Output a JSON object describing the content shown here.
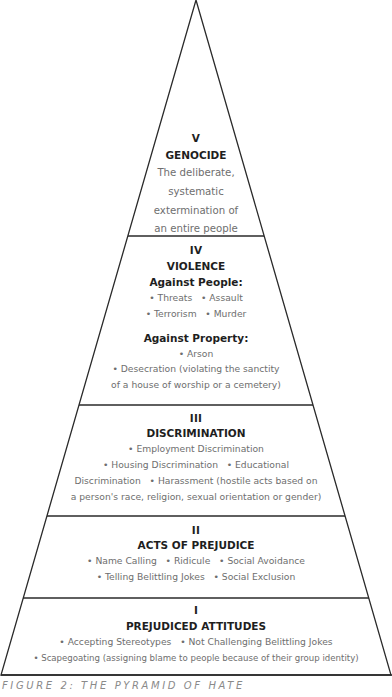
{
  "figure": {
    "caption": "FIGURE 2: THE PYRAMID OF HATE",
    "colors": {
      "line": "#2a2a2a",
      "heading": "#1e1e1e",
      "body": "#6e6e6e",
      "caption": "#8a8a8a"
    }
  },
  "levels": [
    {
      "numeral": "V",
      "title": "GENOCIDE",
      "lines": [
        "The deliberate,",
        "systematic",
        "extermination of",
        "an entire people"
      ]
    },
    {
      "numeral": "IV",
      "title": "VIOLENCE",
      "groups": [
        {
          "heading": "Against People:",
          "lines": [
            "• Threats   • Assault",
            "• Terrorism   • Murder"
          ]
        },
        {
          "heading": "Against Property:",
          "lines": [
            "• Arson",
            "• Desecration (violating the sanctity",
            "of a house of worship or a cemetery)"
          ]
        }
      ]
    },
    {
      "numeral": "III",
      "title": "DISCRIMINATION",
      "lines": [
        "• Employment Discrimination",
        "• Housing Discrimination   • Educational",
        "Discrimination   • Harassment (hostile acts based on",
        "a person's race, religion, sexual orientation or gender)"
      ]
    },
    {
      "numeral": "II",
      "title": "ACTS OF PREJUDICE",
      "lines": [
        "• Name Calling   • Ridicule   • Social Avoidance",
        "• Telling Belittling Jokes   • Social Exclusion"
      ]
    },
    {
      "numeral": "I",
      "title": "PREJUDICED ATTITUDES",
      "lines": [
        "• Accepting Stereotypes   • Not Challenging Belittling Jokes",
        "• Scapegoating (assigning blame to people because of their group identity)"
      ]
    }
  ]
}
